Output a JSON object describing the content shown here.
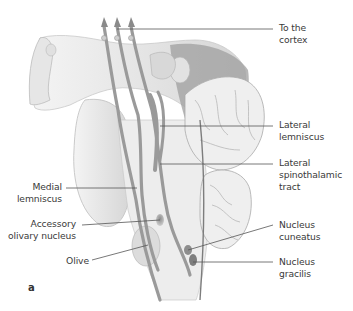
{
  "figure": {
    "panel_letter": "a",
    "labels": {
      "to_cortex": "To the\ncortex",
      "lateral_lemniscus": "Lateral\nlemniscus",
      "lateral_spinothalamic": "Lateral\nspinothalamic\ntract",
      "medial_lemniscus": "Medial\nlemniscus",
      "accessory_olivary": "Accessory\nolivary nucleus",
      "olive": "Olive",
      "nucleus_cuneatus": "Nucleus\ncuneatus",
      "nucleus_gracilis": "Nucleus\ngracilis"
    },
    "colors": {
      "tissue_light": "#ececec",
      "tissue_mid": "#cfcfcf",
      "tract": "#9a9a9a",
      "leader_line": "#555555",
      "text": "#3a3a3a"
    }
  }
}
